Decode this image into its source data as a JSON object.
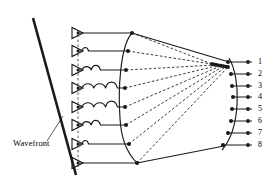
{
  "figure": {
    "type": "diagram",
    "background_color": "#ffffff",
    "stroke_color": "#1a1a1a",
    "width": 278,
    "height": 189
  },
  "labels": {
    "wavefront": "Wavefront"
  },
  "wavefront": {
    "line": {
      "x1": 33,
      "y1": 18,
      "x2": 76,
      "y2": 175,
      "stroke_width": 2.6
    },
    "leader": {
      "x1": 47,
      "y1": 141,
      "x2": 62,
      "y2": 117,
      "stroke_width": 0.7
    }
  },
  "elements": {
    "count": 8,
    "amplifier_x": 72,
    "amplifier_width": 11,
    "amplifier_height": 11,
    "bus_x": 78,
    "rows_y": [
      33,
      51,
      70,
      88,
      107,
      125,
      144,
      163
    ],
    "delay_sizes": [
      0,
      1,
      2,
      3,
      3,
      2,
      1,
      0
    ],
    "delay_labels": [
      "none",
      "small",
      "medium",
      "large",
      "large",
      "medium",
      "small",
      "none"
    ]
  },
  "left_arc": {
    "dots_x": [
      132,
      128,
      126,
      125,
      125,
      126,
      129,
      137
    ],
    "dots_y": [
      33,
      51,
      70,
      88,
      107,
      125,
      144,
      163
    ]
  },
  "focal_cluster": {
    "x_start": 212,
    "x_end": 228,
    "y": 64,
    "dot_count": 8
  },
  "right_arc": {
    "dots_x": [
      228,
      231,
      232,
      233,
      232,
      231,
      228,
      223
    ],
    "dots_y": [
      62,
      74,
      86,
      97,
      109,
      121,
      133,
      145
    ]
  },
  "output_ports": {
    "line_end_x": 252,
    "label_x": 258,
    "labels": [
      "1",
      "2",
      "3",
      "4",
      "5",
      "6",
      "7",
      "8"
    ]
  },
  "envelope": {
    "top_path": "M132,33 L228,62",
    "bottom_path": "M137,163 L223,145"
  }
}
